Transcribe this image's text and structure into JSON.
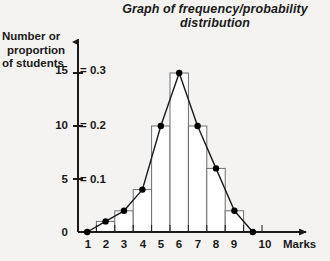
{
  "chart_data": {
    "type": "bar",
    "title": "Graph of frequency/probability distribution",
    "title_line1": "Graph of frequency/probability",
    "title_line2": "distribution",
    "xlabel": "Marks",
    "ylabel": "Number or proportion of students",
    "ylabel_line1": "Number or",
    "ylabel_line2": "proportion",
    "ylabel_line3": "of students",
    "grid": false,
    "legend": "none",
    "xlim": [
      0,
      10
    ],
    "ylim": [
      0,
      17
    ],
    "categories": [
      "0-1",
      "1-2",
      "2-3",
      "3-4",
      "4-5",
      "5-6",
      "6-7",
      "7-8",
      "8-9",
      "9-10"
    ],
    "bin_edges": [
      0,
      1,
      2,
      3,
      4,
      5,
      6,
      7,
      8,
      9,
      10
    ],
    "values": [
      0,
      1,
      2,
      4,
      10,
      15,
      10,
      6,
      2,
      0
    ],
    "series": [
      {
        "name": "Frequency histogram",
        "values": [
          0,
          1,
          2,
          4,
          10,
          15,
          10,
          6,
          2,
          0
        ]
      },
      {
        "name": "Frequency polygon",
        "x": [
          0.5,
          1.5,
          2.5,
          3.5,
          4.5,
          5.5,
          6.5,
          7.5,
          8.5,
          9.5
        ],
        "values": [
          0,
          1,
          2,
          4,
          10,
          15,
          10,
          6,
          2,
          0
        ]
      }
    ],
    "y_ticks_count": [
      0,
      5,
      10,
      15
    ],
    "y_ticks_proportion": [
      "0.1",
      "0.2",
      "0.3"
    ],
    "y_dual_axis": [
      {
        "count": "15",
        "separator": "=",
        "proportion": "0.3"
      },
      {
        "count": "10",
        "separator": "=",
        "proportion": "0.2"
      },
      {
        "count": "5",
        "separator": "=",
        "proportion": "0.1"
      },
      {
        "count": "0",
        "separator": "",
        "proportion": ""
      }
    ],
    "x_tick_labels": [
      "1",
      "2",
      "3",
      "4",
      "5",
      "6",
      "7",
      "8",
      "9",
      "10"
    ],
    "colors": {
      "background": "#f4f3f1",
      "axis": "#1a1a1a",
      "bar_stroke": "#6e6e6e",
      "bar_fill": "#ffffff",
      "polygon_line": "#1a1a1a",
      "marker": "#000000",
      "text": "#1a1a1a"
    }
  },
  "axis": {
    "origin_label": "0",
    "x_axis_name": "Marks"
  }
}
